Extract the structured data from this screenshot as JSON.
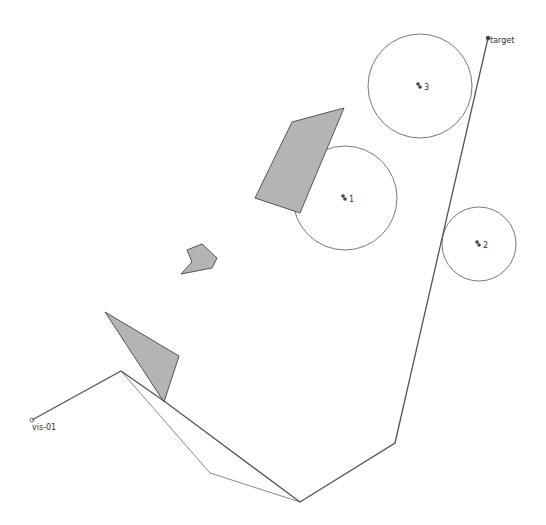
{
  "canvas": {
    "width": 546,
    "height": 525,
    "background": "#ffffff"
  },
  "colors": {
    "obstacle_fill": "#b4b4b4",
    "obstacle_stroke": "#555555",
    "path_dark": "#555555",
    "path_light": "#8a8a8a",
    "circle_stroke": "#7a7a7a",
    "marker": "#444444"
  },
  "start": {
    "label": "vis-01",
    "x": 32,
    "y": 420
  },
  "target": {
    "label": "target",
    "x": 488,
    "y": 38
  },
  "obstacles": [
    {
      "name": "quad",
      "points": "292,122 344,108 300,213 255,198"
    },
    {
      "name": "small-poly",
      "points": "187,250 202,244 217,258 212,268 181,274 192,262"
    },
    {
      "name": "triangle",
      "points": "105,312 179,356 164,402"
    }
  ],
  "zones": [
    {
      "label": "1",
      "cx": 345,
      "cy": 198,
      "r": 52
    },
    {
      "label": "2",
      "cx": 479,
      "cy": 244,
      "r": 37
    },
    {
      "label": "3",
      "cx": 420,
      "cy": 86,
      "r": 52
    }
  ],
  "paths": {
    "main": "32,420 121,371 164,401 300,502 395,443 488,38",
    "alternate": "121,371 210,473 300,502"
  }
}
